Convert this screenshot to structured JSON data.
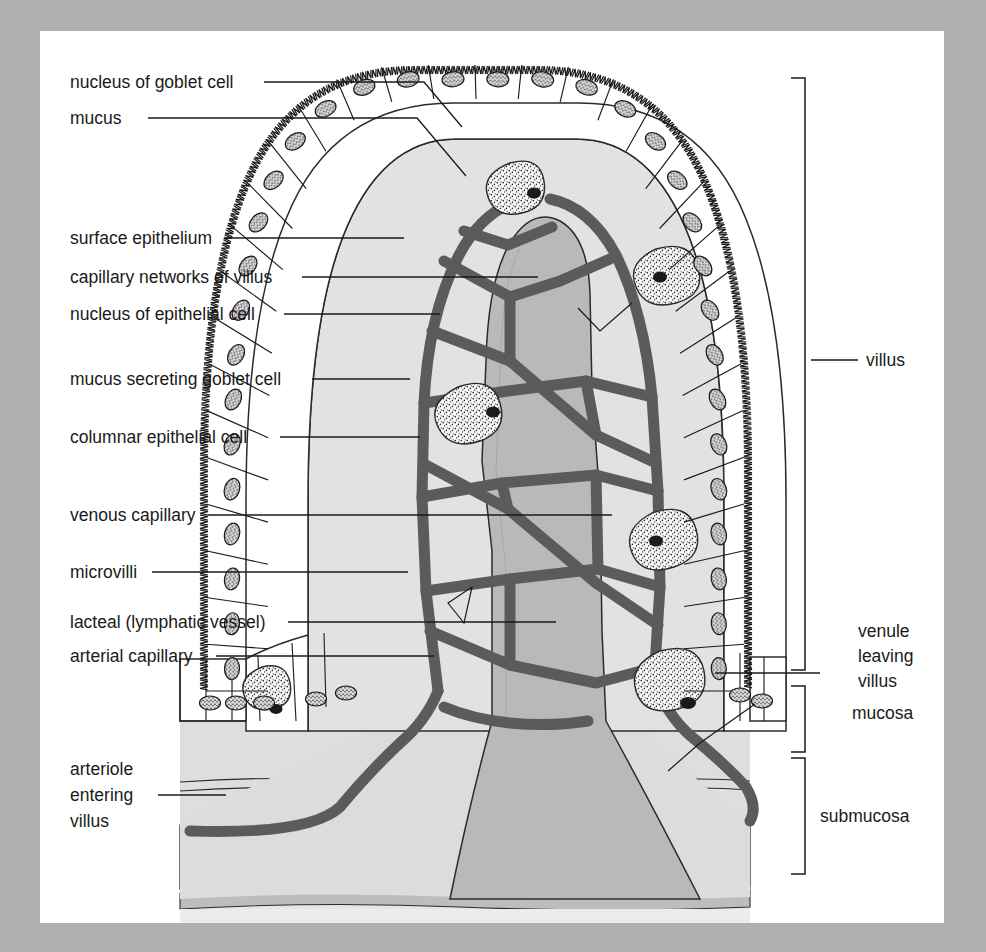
{
  "figure": {
    "type": "labelled anatomical cross-section diagram",
    "canvas": {
      "width": 986,
      "height": 952
    },
    "page": {
      "x": 40,
      "y": 31,
      "width": 904,
      "height": 892,
      "background": "#ffffff"
    },
    "backdrop_color": "#b0b0b0"
  },
  "palette": {
    "ink": "#1a1a1a",
    "lamina_propria": "#e2e2e2",
    "lacteal": "#b9b9b9",
    "capillary": "#5b5b5b",
    "capillary_edge": "#3b3b3b",
    "mucosa_fill": "#dedede",
    "submucosa_fill": "#e3e3e3",
    "submucosa_band": "#c4c4c4",
    "muscularis_band": "#bdbdbd",
    "epithelium_fill": "#ffffff",
    "goblet_fill": "#fbfbfb",
    "nucleus_fill": "#d8d8d8"
  },
  "left_labels": [
    {
      "id": "nucleus-of-goblet-cell",
      "text": "nucleus of goblet cell",
      "x": 70,
      "y": 88,
      "leader": "M 264 82 L 424 82 L 462 127"
    },
    {
      "id": "mucus",
      "text": "mucus",
      "x": 70,
      "y": 124,
      "leader": "M 148 118 L 417 118 L 466 176"
    },
    {
      "id": "surface-epithelium",
      "text": "surface epithelium",
      "x": 70,
      "y": 244,
      "leader": "M 224 238 L 404 238"
    },
    {
      "id": "capillary-networks-of-villus",
      "text": "capillary networks of villus",
      "x": 70,
      "y": 283,
      "leader": "M 302 277 L 538 277"
    },
    {
      "id": "nucleus-of-epithelial-cell",
      "text": "nucleus of epithelial cell",
      "x": 70,
      "y": 320,
      "leader": "M 284 314 L 440 314"
    },
    {
      "id": "mucus-secreting-goblet-cell",
      "text": "mucus secreting goblet cell",
      "x": 70,
      "y": 385,
      "leader": "M 312 379 L 410 379"
    },
    {
      "id": "columnar-epithelial-cell",
      "text": "columnar epithelial cell",
      "x": 70,
      "y": 443,
      "leader": "M 280 437 L 420 437"
    },
    {
      "id": "venous-capillary",
      "text": "venous capillary",
      "x": 70,
      "y": 521,
      "leader": "M 208 515 L 612 515"
    },
    {
      "id": "microvilli",
      "text": "microvilli",
      "x": 70,
      "y": 578,
      "leader": "M 152 572 L 408 572"
    },
    {
      "id": "lacteal-lymphatic-vessel",
      "text": "lacteal (lymphatic vessel)",
      "x": 70,
      "y": 628,
      "leader": "M 288 622 L 556 622"
    },
    {
      "id": "arterial-capillary",
      "text": "arterial capillary",
      "x": 70,
      "y": 662,
      "leader": "M 216 656 L 434 656"
    }
  ],
  "multiline_labels": [
    {
      "id": "arteriole-entering-villus",
      "lines": [
        "arteriole",
        "entering",
        "villus"
      ],
      "x": 70,
      "y_first": 775,
      "line_height": 26,
      "leader": "M 158 795 L 226 795"
    }
  ],
  "right_labels": [
    {
      "id": "villus",
      "text": "villus",
      "x": 866,
      "y": 366,
      "leader": "M 811 360 L 858 360"
    },
    {
      "id": "mucosa",
      "text": "mucosa",
      "x": 852,
      "y": 719
    },
    {
      "id": "submucosa",
      "text": "submucosa",
      "x": 820,
      "y": 822
    }
  ],
  "right_multiline_labels": [
    {
      "id": "venule-leaving-villus",
      "lines": [
        "venule",
        "leaving",
        "villus"
      ],
      "x": 858,
      "y_first": 637,
      "line_height": 25,
      "leader": "M 715 673 L 820 673"
    }
  ],
  "brackets": [
    {
      "id": "villus-bracket",
      "x": 805,
      "y_top": 78,
      "y_bottom": 670,
      "tick": 14,
      "label": "villus"
    },
    {
      "id": "mucosa-bracket",
      "x": 805,
      "y_top": 686,
      "y_bottom": 752,
      "tick": 14,
      "label": "mucosa"
    },
    {
      "id": "submucosa-bracket",
      "x": 805,
      "y_top": 758,
      "y_bottom": 874,
      "tick": 14,
      "label": "submucosa"
    }
  ],
  "structures": {
    "villus_axis_x": 476,
    "villus_tip_y": 90,
    "base_y": 690,
    "mucosa_top_y": 690,
    "mucosa_bottom_y": 752,
    "submucosa_top_y": 752,
    "submucosa_bottom_y": 892,
    "epithelium_thickness": 62,
    "goblet_cells": 6,
    "epithelial_nuclei_left": 14,
    "epithelial_nuclei_right": 14,
    "capillary_network_nodes": 22
  },
  "chart_data": {
    "type": "table",
    "categories": [
      "nucleus of goblet cell",
      "mucus",
      "surface epithelium",
      "capillary networks of villus",
      "nucleus of epithelial cell",
      "mucus secreting goblet cell",
      "columnar epithelial cell",
      "venous capillary",
      "microvilli",
      "lacteal (lymphatic vessel)",
      "arterial capillary",
      "arteriole entering villus",
      "venule leaving villus",
      "villus",
      "mucosa",
      "submucosa"
    ],
    "side": [
      "left",
      "left",
      "left",
      "left",
      "left",
      "left",
      "left",
      "left",
      "left",
      "left",
      "left",
      "left",
      "right",
      "right",
      "right",
      "right"
    ]
  }
}
